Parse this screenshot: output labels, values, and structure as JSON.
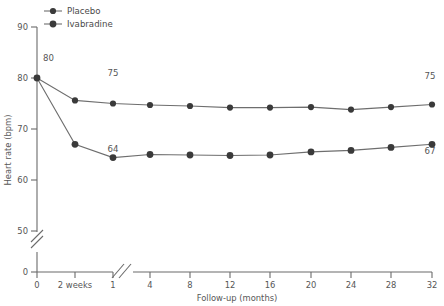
{
  "chart_data": {
    "type": "line",
    "title": "",
    "xlabel": "Follow-up (months)",
    "ylabel": "Heart rate (bpm)",
    "x_ticklabels": [
      "0",
      "2 weeks",
      "1",
      "4",
      "8",
      "12",
      "16",
      "20",
      "24",
      "28",
      "32"
    ],
    "y_ticklabels": [
      "0",
      "50",
      "60",
      "70",
      "80",
      "90"
    ],
    "y_ticks": [
      0,
      50,
      60,
      70,
      80,
      90
    ],
    "ylim": [
      50,
      90
    ],
    "y_axis_break": true,
    "x_axis_break": true,
    "x_axis_break_between": [
      "1",
      "4"
    ],
    "grid": false,
    "legend_position": "top-left",
    "series": [
      {
        "name": "Placebo",
        "color": "#3a3a3a",
        "x": [
          "0",
          "2 weeks",
          "1",
          "4",
          "8",
          "12",
          "16",
          "20",
          "24",
          "28",
          "32"
        ],
        "values": [
          80,
          75.6,
          75,
          74.7,
          74.5,
          74.2,
          74.2,
          74.3,
          73.8,
          74.3,
          74.8
        ]
      },
      {
        "name": "Ivabradine",
        "color": "#3a3a3a",
        "x": [
          "0",
          "2 weeks",
          "1",
          "4",
          "8",
          "12",
          "16",
          "20",
          "24",
          "28",
          "32"
        ],
        "values": [
          80,
          67.0,
          64.4,
          65.0,
          64.9,
          64.8,
          64.9,
          65.5,
          65.8,
          66.4,
          67.0
        ]
      }
    ],
    "annotations": [
      {
        "text": "80",
        "series": "shared",
        "x": "0",
        "value": 80,
        "position": "above-right"
      },
      {
        "text": "75",
        "series": "Placebo",
        "x": "1",
        "value": 75,
        "position": "above"
      },
      {
        "text": "75",
        "series": "Placebo",
        "x": "32",
        "value": 74.8,
        "position": "above"
      },
      {
        "text": "64",
        "series": "Ivabradine",
        "x": "1",
        "value": 64.4,
        "position": "below"
      },
      {
        "text": "67",
        "series": "Ivabradine",
        "x": "32",
        "value": 67.0,
        "position": "below"
      }
    ]
  },
  "legend": {
    "items": [
      {
        "label": "Placebo"
      },
      {
        "label": "Ivabradine"
      }
    ]
  },
  "axes": {
    "y_title": "Heart rate (bpm)",
    "x_title": "Follow-up (months)",
    "y_labels": {
      "t90": "90",
      "t80": "80",
      "t70": "70",
      "t60": "60",
      "t50": "50",
      "t0": "0"
    },
    "x_labels": {
      "x0": "0",
      "x2w": "2 weeks",
      "x1": "1",
      "x4": "4",
      "x8": "8",
      "x12": "12",
      "x16": "16",
      "x20": "20",
      "x24": "24",
      "x28": "28",
      "x32": "32"
    },
    "origin_label": "0"
  },
  "annotations": {
    "start": "80",
    "placebo_month1": "75",
    "placebo_month32": "75",
    "ivabradine_month1": "64",
    "ivabradine_month32": "67"
  }
}
